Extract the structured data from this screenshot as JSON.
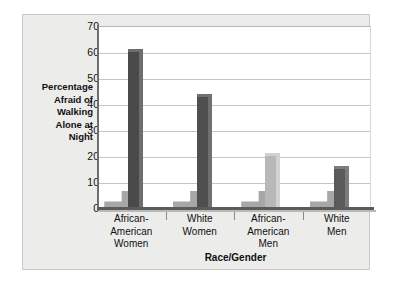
{
  "chart_data": {
    "type": "bar",
    "title": "",
    "categories": [
      "African-American Women",
      "White Women",
      "African-American Men",
      "White Men"
    ],
    "category_label_lines": [
      "African-\nAmerican\nWomen",
      "White\nWomen",
      "African-\nAmerican\nMen",
      "White\nMen"
    ],
    "values": [
      61,
      44,
      21,
      16
    ],
    "series": [
      {
        "name": "Percentage Afraid of Walking Alone at Night",
        "values": [
          61,
          44,
          21,
          16
        ]
      }
    ],
    "xlabel": "Race/Gender",
    "ylabel": "Percentage Afraid of Walking Alone at Night",
    "ylabel_lines": "Percentage\nAfraid of\nWalking\nAlone at\nNight",
    "ylim": [
      0,
      70
    ],
    "ytick_values": [
      0,
      10,
      20,
      30,
      40,
      50,
      60,
      70
    ],
    "ytick_labels": [
      "0",
      "10",
      "20",
      "30",
      "40",
      "50",
      "60",
      "70"
    ],
    "grid": true,
    "grid_orientation": "horizontal",
    "legend": false,
    "legend_position": "none",
    "bar_colors": [
      "#4a4a4a",
      "#4f4f4f",
      "#b8b8b8",
      "#5a5a5a"
    ],
    "bar_side_colors": [
      "#6d6d6d",
      "#707070",
      "#d2d2d2",
      "#7c7c7c"
    ],
    "bar_shadow_color": "#a7a7a5",
    "plot_background": "#ffffff",
    "panel_background": "#ececeb",
    "gridline_color": "#c5c5c3",
    "axis_color": "#5b5b59",
    "text_color": "#101010"
  }
}
